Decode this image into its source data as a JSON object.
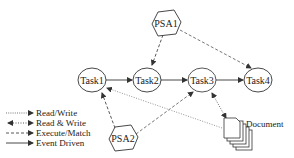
{
  "diagram": {
    "nodes": {
      "psa1": {
        "label": "PSA1",
        "shape": "hexagon"
      },
      "psa2": {
        "label": "PSA2",
        "shape": "hexagon"
      },
      "task1": {
        "label": "Task1",
        "shape": "ellipse"
      },
      "task2": {
        "label": "Task2",
        "shape": "ellipse"
      },
      "task3": {
        "label": "Task3",
        "shape": "ellipse"
      },
      "task4": {
        "label": "Task4",
        "shape": "ellipse"
      },
      "document": {
        "label": "Document",
        "shape": "document-stack"
      }
    },
    "edges": [
      {
        "from": "Task1",
        "to": "Task2",
        "type": "Event Driven"
      },
      {
        "from": "Task2",
        "to": "Task3",
        "type": "Event Driven"
      },
      {
        "from": "Task3",
        "to": "Task4",
        "type": "Event Driven"
      },
      {
        "from": "PSA1",
        "to": "Task2",
        "type": "Execute/Match"
      },
      {
        "from": "PSA1",
        "to": "Task4",
        "type": "Execute/Match"
      },
      {
        "from": "PSA2",
        "to": "Task1",
        "type": "Execute/Match"
      },
      {
        "from": "PSA2",
        "to": "Task3",
        "type": "Execute/Match"
      },
      {
        "from": "Document",
        "to": "Task1",
        "type": "Read/Write"
      },
      {
        "from": "Task3",
        "to": "Document",
        "type": "Read & Write"
      }
    ]
  },
  "legend": {
    "items": [
      {
        "label": "Read/Write",
        "style": "dotted"
      },
      {
        "label": "Read & Write",
        "style": "dotted-bidirectional"
      },
      {
        "label": "Execute/Match",
        "style": "dashed"
      },
      {
        "label": "Event Driven",
        "style": "solid"
      }
    ]
  },
  "colors": {
    "stroke": "#333333",
    "dotted_line": "#888888",
    "fill": "#ffffff"
  }
}
